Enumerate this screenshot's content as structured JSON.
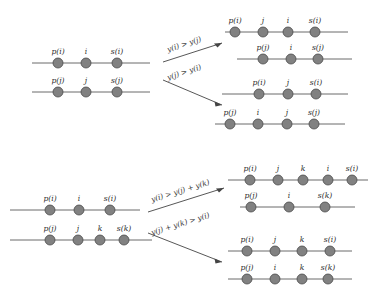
{
  "figure": {
    "background_color": "#ffffff",
    "node_color": "#818181",
    "node_stroke_color": "#4a4a4a",
    "line_color": "#6b6b6b",
    "arrow_color": "#444444"
  },
  "groups": [
    {
      "id": "top",
      "name": "two-element-case",
      "source": {
        "lines": [
          {
            "id": "top-src-line-1",
            "nodes": [
              "p(i)",
              "i",
              "s(i)"
            ]
          },
          {
            "id": "top-src-line-2",
            "nodes": [
              "p(j)",
              "j",
              "s(j)"
            ]
          }
        ]
      },
      "branches": [
        {
          "id": "top-branch-1",
          "condition": "y(i) > y(j)",
          "direction": "up",
          "lines": [
            {
              "id": "top-b1-line-1",
              "nodes": [
                "p(i)",
                "j",
                "i",
                "s(i)"
              ]
            },
            {
              "id": "top-b1-line-2",
              "nodes": [
                "p(j)",
                "i",
                "s(j)"
              ]
            }
          ]
        },
        {
          "id": "top-branch-2",
          "condition": "y(j) > y(i)",
          "direction": "down",
          "lines": [
            {
              "id": "top-b2-line-1",
              "nodes": [
                "p(i)",
                "j",
                "s(i)"
              ]
            },
            {
              "id": "top-b2-line-2",
              "nodes": [
                "p(j)",
                "i",
                "j",
                "s(j)"
              ]
            }
          ]
        }
      ]
    },
    {
      "id": "bottom",
      "name": "three-element-case",
      "source": {
        "lines": [
          {
            "id": "bot-src-line-1",
            "nodes": [
              "p(i)",
              "i",
              "s(i)"
            ]
          },
          {
            "id": "bot-src-line-2",
            "nodes": [
              "p(j)",
              "j",
              "k",
              "s(k)"
            ]
          }
        ]
      },
      "branches": [
        {
          "id": "bot-branch-1",
          "condition": "y(i) > y(j) + y(k)",
          "direction": "up",
          "lines": [
            {
              "id": "bot-b1-line-1",
              "nodes": [
                "p(i)",
                "j",
                "k",
                "i",
                "s(i)"
              ]
            },
            {
              "id": "bot-b1-line-2",
              "nodes": [
                "p(j)",
                "i",
                "s(k)"
              ]
            }
          ]
        },
        {
          "id": "bot-branch-2",
          "condition": "y(j) + y(k) > y(i)",
          "direction": "down",
          "lines": [
            {
              "id": "bot-b2-line-1",
              "nodes": [
                "p(i)",
                "j",
                "k",
                "s(i)"
              ]
            },
            {
              "id": "bot-b2-line-2",
              "nodes": [
                "p(j)",
                "i",
                "k",
                "s(k)"
              ]
            }
          ]
        }
      ]
    }
  ]
}
